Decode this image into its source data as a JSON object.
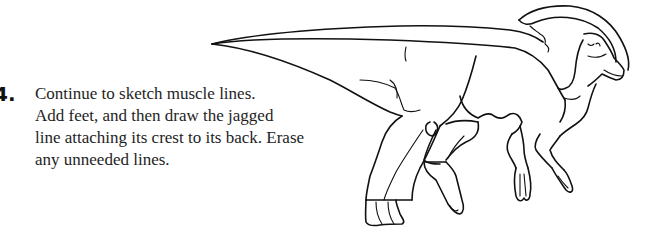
{
  "step": {
    "number": "4.",
    "lines": [
      "Continue to sketch muscle lines.",
      "Add feet, and then draw the jagged",
      "line attaching its crest to its back. Erase",
      "any unneeded lines."
    ]
  },
  "illustration": {
    "subject": "dinosaur-sketch-icon",
    "description": "Line drawing of a crested hadrosaur (Parasaurolophus) with muscle lines, feet, and crest attached to back"
  }
}
